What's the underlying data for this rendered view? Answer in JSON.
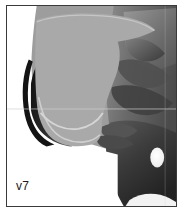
{
  "figure": {
    "kind": "grayscale-medical-scan",
    "view": "lateral-head-and-neck",
    "label": "v7",
    "border_color": "#3a3a3a",
    "background_color": "#ffffff"
  },
  "palette": {
    "overlay_gray": "#a9a9a9",
    "overlay_outline": "#c9c9c9",
    "soft_tissue_mid": "#8e8e8e",
    "soft_tissue_dark": "#4a4a4a",
    "deep_shadow": "#1f1f1f",
    "near_black": "#111111",
    "highlight_white": "#f6f6f6",
    "frame": "#3a3a3a",
    "paper": "#ffffff"
  },
  "regions": [
    {
      "name": "overlay-region",
      "description": "light gray shaded oral cavity / tongue overlay",
      "fill": "#a9a9a9"
    },
    {
      "name": "overlay-contour-line",
      "description": "pale curved contour line inside overlay",
      "stroke": "#cfcfcf"
    },
    {
      "name": "anterior-dark-band",
      "description": "dark curved band at left anterior margin",
      "fill": "#1f1f1f"
    },
    {
      "name": "posterior-tissue-mass",
      "description": "mid gray tissue mass at right",
      "fill": "#6f6f6f"
    },
    {
      "name": "bright-oval-void",
      "description": "small bright oval air space lower right",
      "fill": "#f6f6f6"
    },
    {
      "name": "horizontal-scan-line",
      "description": "faint horizontal reference line across mid image",
      "stroke": "#d4d4d4"
    },
    {
      "name": "lower-white-field",
      "description": "white field at lower left of plate",
      "fill": "#ffffff"
    }
  ]
}
